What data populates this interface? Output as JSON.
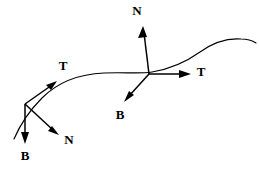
{
  "figure": {
    "background_color": "#ffffff",
    "stroke_color": "#000000",
    "width": 259,
    "height": 176
  },
  "curve": {
    "name": "space-curve",
    "path": "M 14,139 C 20,125 28,112 42,98 C 58,82 80,74 104,73 C 124,72 140,74 152,72 C 170,69 186,62 200,52 C 214,42 228,38 241,39 C 248,39 253,41 256,43",
    "stroke_width": 1.15
  },
  "frames": [
    {
      "id": "left-frame",
      "origin": {
        "x": 25,
        "y": 104
      },
      "vectors": [
        {
          "id": "left-tangent",
          "label": "T",
          "name": "tangent-vector",
          "tip": {
            "x": 56,
            "y": 82
          },
          "label_pos": {
            "x": 63,
            "y": 67
          }
        },
        {
          "id": "left-normal",
          "label": "N",
          "name": "normal-vector",
          "tip": {
            "x": 58,
            "y": 134
          },
          "label_pos": {
            "x": 69,
            "y": 141
          }
        },
        {
          "id": "left-binormal",
          "label": "B",
          "name": "binormal-vector",
          "tip": {
            "x": 25,
            "y": 143
          },
          "label_pos": {
            "x": 25,
            "y": 157
          }
        }
      ]
    },
    {
      "id": "right-frame",
      "origin": {
        "x": 149,
        "y": 74
      },
      "vectors": [
        {
          "id": "right-tangent",
          "label": "T",
          "name": "tangent-vector",
          "tip": {
            "x": 190,
            "y": 74
          },
          "label_pos": {
            "x": 201,
            "y": 73
          }
        },
        {
          "id": "right-normal",
          "label": "N",
          "name": "normal-vector",
          "tip": {
            "x": 143,
            "y": 26
          },
          "label_pos": {
            "x": 137,
            "y": 12
          }
        },
        {
          "id": "right-binormal",
          "label": "B",
          "name": "binormal-vector",
          "tip": {
            "x": 125,
            "y": 101
          },
          "label_pos": {
            "x": 120,
            "y": 116
          }
        }
      ]
    }
  ],
  "guide_segments": [
    {
      "id": "left-frame-backline",
      "name": "curve-extension-left",
      "path": "M 14,139 L 25,104"
    },
    {
      "id": "right-frame-backline",
      "name": "curve-extension-right",
      "path": "M 104,73 L 152,72"
    }
  ]
}
